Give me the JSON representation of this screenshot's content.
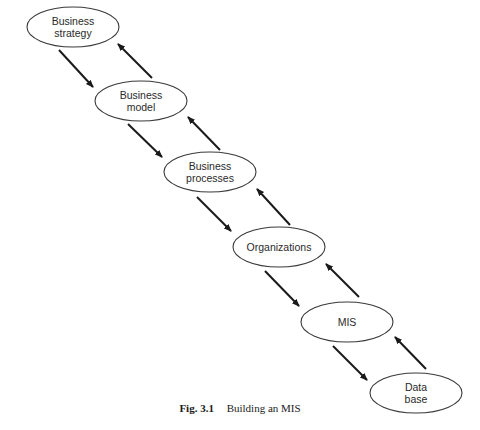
{
  "diagram": {
    "nodes": [
      {
        "id": "business-strategy",
        "lines": [
          "Business",
          "strategy"
        ],
        "cx": 73,
        "cy": 27,
        "rx": 46,
        "ry": 20
      },
      {
        "id": "business-model",
        "lines": [
          "Business",
          "model"
        ],
        "cx": 141,
        "cy": 101,
        "rx": 46,
        "ry": 20
      },
      {
        "id": "business-processes",
        "lines": [
          "Business",
          "processes"
        ],
        "cx": 210,
        "cy": 172,
        "rx": 46,
        "ry": 20
      },
      {
        "id": "organizations",
        "lines": [
          "Organizations"
        ],
        "cx": 279,
        "cy": 247,
        "rx": 46,
        "ry": 20
      },
      {
        "id": "mis",
        "lines": [
          "MIS"
        ],
        "cx": 347,
        "cy": 322,
        "rx": 46,
        "ry": 20
      },
      {
        "id": "data-base",
        "lines": [
          "Data",
          "base"
        ],
        "cx": 416,
        "cy": 393,
        "rx": 46,
        "ry": 20
      }
    ],
    "arrows": [
      {
        "from": "business-strategy",
        "to": "business-model",
        "direction": "down",
        "x1": 59,
        "y1": 50,
        "x2": 93,
        "y2": 87
      },
      {
        "from": "business-model",
        "to": "business-strategy",
        "direction": "up",
        "x1": 152,
        "y1": 78,
        "x2": 118,
        "y2": 44
      },
      {
        "from": "business-model",
        "to": "business-processes",
        "direction": "down",
        "x1": 128,
        "y1": 124,
        "x2": 162,
        "y2": 157
      },
      {
        "from": "business-processes",
        "to": "business-model",
        "direction": "up",
        "x1": 220,
        "y1": 150,
        "x2": 188,
        "y2": 117
      },
      {
        "from": "business-processes",
        "to": "organizations",
        "direction": "down",
        "x1": 197,
        "y1": 197,
        "x2": 231,
        "y2": 231
      },
      {
        "from": "organizations",
        "to": "business-processes",
        "direction": "up",
        "x1": 290,
        "y1": 225,
        "x2": 257,
        "y2": 189
      },
      {
        "from": "organizations",
        "to": "mis",
        "direction": "down",
        "x1": 265,
        "y1": 271,
        "x2": 299,
        "y2": 306
      },
      {
        "from": "mis",
        "to": "organizations",
        "direction": "up",
        "x1": 359,
        "y1": 297,
        "x2": 326,
        "y2": 264
      },
      {
        "from": "mis",
        "to": "data-base",
        "direction": "down",
        "x1": 333,
        "y1": 346,
        "x2": 367,
        "y2": 380
      },
      {
        "from": "data-base",
        "to": "mis",
        "direction": "up",
        "x1": 426,
        "y1": 369,
        "x2": 395,
        "y2": 337
      }
    ]
  },
  "caption": {
    "number": "Fig. 3.1",
    "text": "Building an MIS"
  },
  "colors": {
    "stroke": "#3a3a3a",
    "arrow": "#1a1a1a",
    "text": "#2a2a2a",
    "background": "#ffffff"
  }
}
